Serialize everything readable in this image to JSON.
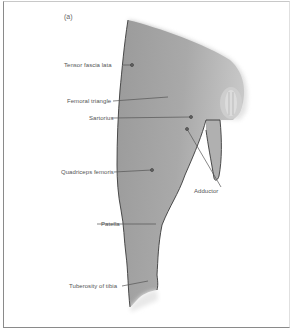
{
  "figure": {
    "panel_label": "(a)",
    "colors": {
      "limb_fill_dark": "#8e8e8e",
      "limb_fill_light": "#d2d2d2",
      "outline": "#3a3a3a",
      "leader_line": "#555555",
      "label_text": "#555555",
      "frame": "#8a8a8a"
    }
  },
  "labels": [
    {
      "id": "tensor-fascia-lata",
      "text": "Tensor fascia lata"
    },
    {
      "id": "femoral-triangle",
      "text": "Femoral triangle"
    },
    {
      "id": "sartorius",
      "text": "Sartorius"
    },
    {
      "id": "quadriceps-femoris",
      "text": "Quadriceps femoris"
    },
    {
      "id": "adductor",
      "text": "Adductor"
    },
    {
      "id": "patella",
      "text": "Patella"
    },
    {
      "id": "tuberosity-of-tibia",
      "text": "Tuberosity of tibia"
    }
  ]
}
